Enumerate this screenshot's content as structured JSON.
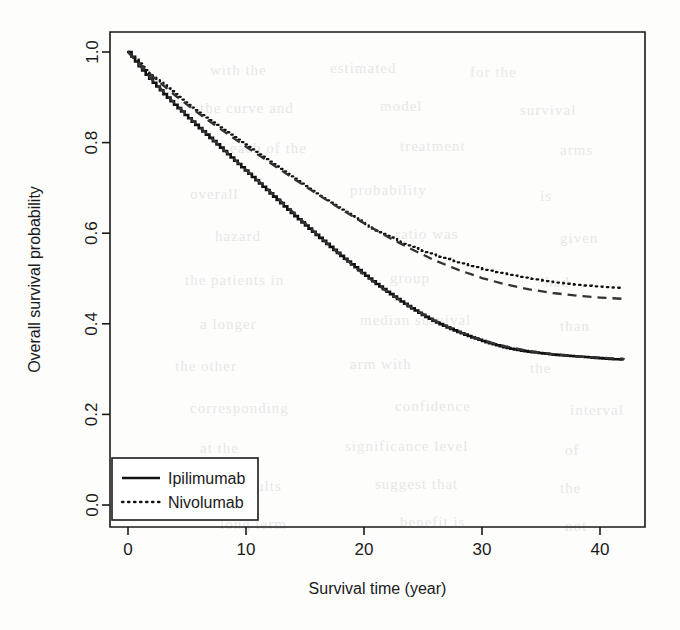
{
  "figure": {
    "background_color": "#fdfdfc",
    "ink_color": "#111111",
    "page_artifact": "scanned-journal-page-with-bleedthrough"
  },
  "axis": {
    "y_title": "Overall survival probability",
    "x_title": "Survival time (year)",
    "y_ticks": [
      "0.0",
      "0.2",
      "0.4",
      "0.6",
      "0.8",
      "1.0"
    ],
    "x_ticks": [
      "0",
      "10",
      "20",
      "30",
      "40"
    ]
  },
  "legend": {
    "items": [
      {
        "label": "Ipilimumab",
        "style": "solid"
      },
      {
        "label": "Nivolumab",
        "style": "dotted"
      }
    ]
  },
  "bleed_text": [
    {
      "text": "with the",
      "x": 210,
      "y": 62
    },
    {
      "text": "estimated",
      "x": 330,
      "y": 60
    },
    {
      "text": "for the",
      "x": 470,
      "y": 64
    },
    {
      "text": "the curve and",
      "x": 200,
      "y": 100
    },
    {
      "text": "model",
      "x": 380,
      "y": 98
    },
    {
      "text": "survival",
      "x": 520,
      "y": 102
    },
    {
      "text": "each of the",
      "x": 230,
      "y": 140
    },
    {
      "text": "treatment",
      "x": 400,
      "y": 138
    },
    {
      "text": "arms",
      "x": 560,
      "y": 142
    },
    {
      "text": "overall",
      "x": 190,
      "y": 186
    },
    {
      "text": "probability",
      "x": 350,
      "y": 182
    },
    {
      "text": "is",
      "x": 540,
      "y": 188
    },
    {
      "text": "hazard",
      "x": 215,
      "y": 228
    },
    {
      "text": "ratio was",
      "x": 395,
      "y": 226
    },
    {
      "text": "given",
      "x": 560,
      "y": 230
    },
    {
      "text": "the patients in",
      "x": 185,
      "y": 272
    },
    {
      "text": "group",
      "x": 390,
      "y": 270
    },
    {
      "text": "had",
      "x": 545,
      "y": 274
    },
    {
      "text": "a longer",
      "x": 200,
      "y": 316
    },
    {
      "text": "median survival",
      "x": 360,
      "y": 312
    },
    {
      "text": "than",
      "x": 560,
      "y": 318
    },
    {
      "text": "the other",
      "x": 175,
      "y": 358
    },
    {
      "text": "arm with",
      "x": 350,
      "y": 356
    },
    {
      "text": "the",
      "x": 530,
      "y": 360
    },
    {
      "text": "corresponding",
      "x": 190,
      "y": 400
    },
    {
      "text": "confidence",
      "x": 395,
      "y": 398
    },
    {
      "text": "interval",
      "x": 570,
      "y": 402
    },
    {
      "text": "at the",
      "x": 200,
      "y": 440
    },
    {
      "text": "significance level",
      "x": 345,
      "y": 438
    },
    {
      "text": "of",
      "x": 565,
      "y": 442
    },
    {
      "text": "these results",
      "x": 195,
      "y": 478
    },
    {
      "text": "suggest that",
      "x": 375,
      "y": 476
    },
    {
      "text": "the",
      "x": 560,
      "y": 480
    },
    {
      "text": "long term",
      "x": 220,
      "y": 516
    },
    {
      "text": "benefit is",
      "x": 400,
      "y": 514
    },
    {
      "text": "not",
      "x": 565,
      "y": 518
    }
  ],
  "chart_data": {
    "type": "line",
    "title": "",
    "xlabel": "Survival time (year)",
    "ylabel": "Overall survival probability",
    "xlim": [
      0,
      42
    ],
    "ylim": [
      0.0,
      1.0
    ],
    "grid": false,
    "legend_position": "bottom-left",
    "x_ticks": [
      0,
      10,
      20,
      30,
      40
    ],
    "y_ticks": [
      0.0,
      0.2,
      0.4,
      0.6,
      0.8,
      1.0
    ],
    "series": [
      {
        "name": "Ipilimumab",
        "style": "solid",
        "kind": "kaplan-meier-step",
        "x": [
          0,
          1,
          2,
          3,
          4,
          5,
          6,
          7,
          8,
          9,
          10,
          11,
          12,
          13,
          14,
          15,
          16,
          17,
          18,
          19,
          20,
          21,
          22,
          23,
          24,
          25,
          26,
          27,
          28,
          29,
          30,
          31,
          32,
          33,
          34,
          35,
          36,
          37,
          38,
          39,
          40,
          41,
          42
        ],
        "y": [
          1.0,
          0.965,
          0.935,
          0.907,
          0.881,
          0.856,
          0.832,
          0.808,
          0.784,
          0.76,
          0.736,
          0.712,
          0.688,
          0.664,
          0.64,
          0.617,
          0.594,
          0.572,
          0.55,
          0.529,
          0.508,
          0.488,
          0.469,
          0.451,
          0.434,
          0.418,
          0.404,
          0.392,
          0.381,
          0.371,
          0.362,
          0.354,
          0.347,
          0.342,
          0.338,
          0.335,
          0.332,
          0.33,
          0.328,
          0.326,
          0.324,
          0.322,
          0.321
        ]
      },
      {
        "name": "Ipilimumab fitted",
        "style": "dashed",
        "kind": "model-fit",
        "x": [
          0,
          2,
          4,
          6,
          8,
          10,
          12,
          14,
          16,
          18,
          20,
          22,
          24,
          26,
          28,
          30,
          32,
          34,
          36,
          38,
          40,
          42
        ],
        "y": [
          1.0,
          0.94,
          0.886,
          0.836,
          0.787,
          0.74,
          0.693,
          0.646,
          0.598,
          0.552,
          0.509,
          0.47,
          0.436,
          0.407,
          0.383,
          0.364,
          0.35,
          0.34,
          0.333,
          0.328,
          0.325,
          0.323
        ]
      },
      {
        "name": "Nivolumab",
        "style": "dotted",
        "kind": "kaplan-meier-step",
        "x": [
          0,
          1,
          2,
          3,
          4,
          5,
          6,
          7,
          8,
          9,
          10,
          11,
          12,
          13,
          14,
          15,
          16,
          17,
          18,
          19,
          20,
          21,
          22,
          23,
          24,
          25,
          26,
          27,
          28,
          29,
          30,
          31,
          32,
          33,
          34,
          35,
          36,
          37,
          38,
          39,
          40,
          41,
          42
        ],
        "y": [
          1.0,
          0.972,
          0.948,
          0.926,
          0.905,
          0.885,
          0.866,
          0.848,
          0.83,
          0.812,
          0.794,
          0.776,
          0.758,
          0.74,
          0.722,
          0.704,
          0.686,
          0.669,
          0.652,
          0.636,
          0.62,
          0.606,
          0.593,
          0.581,
          0.57,
          0.56,
          0.551,
          0.543,
          0.535,
          0.528,
          0.521,
          0.515,
          0.51,
          0.505,
          0.5,
          0.496,
          0.492,
          0.489,
          0.486,
          0.484,
          0.482,
          0.48,
          0.479
        ]
      },
      {
        "name": "Nivolumab fitted",
        "style": "dashed",
        "kind": "model-fit",
        "x": [
          0,
          2,
          4,
          6,
          8,
          10,
          12,
          14,
          16,
          18,
          20,
          22,
          24,
          26,
          28,
          30,
          32,
          34,
          36,
          38,
          40,
          42
        ],
        "y": [
          1.0,
          0.948,
          0.904,
          0.864,
          0.827,
          0.791,
          0.756,
          0.721,
          0.687,
          0.654,
          0.622,
          0.592,
          0.565,
          0.54,
          0.519,
          0.501,
          0.487,
          0.476,
          0.468,
          0.462,
          0.458,
          0.455
        ]
      }
    ]
  }
}
